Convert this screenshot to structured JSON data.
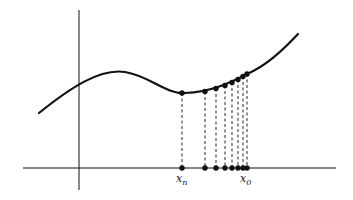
{
  "diagram": {
    "colors": {
      "stroke": "#111111",
      "background": "#ffffff"
    },
    "axes": {
      "vertical": {
        "x": 79,
        "y1": 10,
        "y2": 190
      },
      "horizontal": {
        "y": 168,
        "x1": 23,
        "x2": 336
      }
    },
    "curve": {
      "path": "M39,113 C70,88 100,68 125,72 C150,76 165,94 185,93 C215,92 235,80 255,70 C270,62 285,48 298,34"
    },
    "points": [
      {
        "x": 182,
        "cy": 93
      },
      {
        "x": 205,
        "cy": 91.5
      },
      {
        "x": 216,
        "cy": 88.5
      },
      {
        "x": 225,
        "cy": 85.5
      },
      {
        "x": 232,
        "cy": 82.5
      },
      {
        "x": 238,
        "cy": 79.5
      },
      {
        "x": 243,
        "cy": 76.5
      },
      {
        "x": 247,
        "cy": 74
      }
    ],
    "labels": {
      "left": {
        "base": "x",
        "sub": "n",
        "x": 176,
        "y": 182
      },
      "right": {
        "base": "x",
        "sub": "0",
        "x": 240,
        "y": 182
      }
    }
  }
}
